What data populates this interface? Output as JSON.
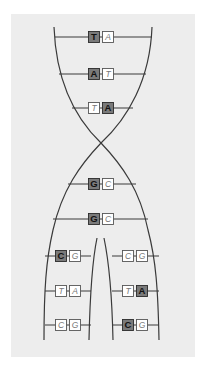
{
  "figure": {
    "colors": {
      "background": "#ededed",
      "strand": "#3a3a3a",
      "dark_base_fill": "#7a7a7a",
      "light_base_fill": "#ffffff"
    },
    "parent_pairs": [
      {
        "left": "T",
        "right": "A",
        "dark": "left"
      },
      {
        "left": "A",
        "right": "T",
        "dark": "left"
      },
      {
        "left": "T",
        "right": "A",
        "dark": "right"
      },
      {
        "left": "G",
        "right": "C",
        "dark": "left"
      },
      {
        "left": "G",
        "right": "C",
        "dark": "left"
      }
    ],
    "daughter_left_pairs": [
      {
        "left": "C",
        "right": "G",
        "dark": "left"
      },
      {
        "left": "T",
        "right": "A",
        "dark": "none"
      },
      {
        "left": "C",
        "right": "G",
        "dark": "none"
      }
    ],
    "daughter_right_pairs": [
      {
        "left": "C",
        "right": "G",
        "dark": "none"
      },
      {
        "left": "T",
        "right": "A",
        "dark": "right"
      },
      {
        "left": "C",
        "right": "G",
        "dark": "left"
      }
    ]
  }
}
